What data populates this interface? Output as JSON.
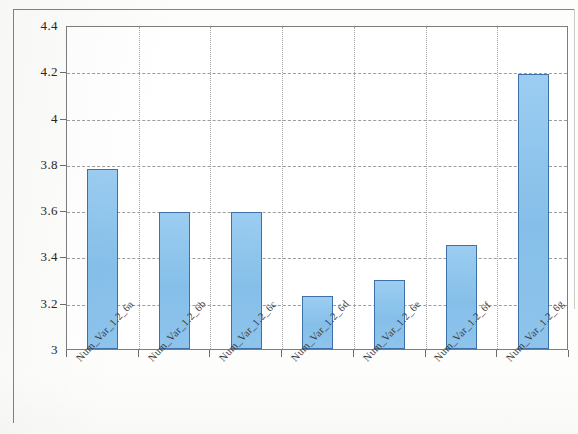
{
  "chart_data": {
    "type": "bar",
    "title": "",
    "subtitle": "",
    "xlabel": "",
    "ylabel": "",
    "categories": [
      "Num_Var_1.2_6a",
      "Num_Var_1.2_6b",
      "Num_Var_1.2_6c",
      "Num_Var_1.2_6d",
      "Num_Var_1.2_6e",
      "Num_Var_1.2_6f",
      "Num_Var_1.2_6g"
    ],
    "values": [
      3.78,
      3.59,
      3.59,
      3.23,
      3.3,
      3.45,
      4.19
    ],
    "ylim": [
      3,
      4.4
    ],
    "ytick_labels": [
      "3",
      "3.2",
      "3.4",
      "3.6",
      "3.8",
      "4",
      "4.2",
      "4.4"
    ],
    "ytick_values": [
      3,
      3.2,
      3.4,
      3.6,
      3.8,
      4,
      4.2,
      4.4
    ],
    "grid": "horizontal-dashed-and-vertical-dotted",
    "legend": null,
    "legend_position": "none",
    "bar_fill_color": "#8ec4ec",
    "bar_border_color": "#3d71a8",
    "plot_border_color": "#7d7d7d",
    "grid_color": "#8c8c8c",
    "background_color": "#ffffff",
    "label_rotation_deg": -47
  }
}
